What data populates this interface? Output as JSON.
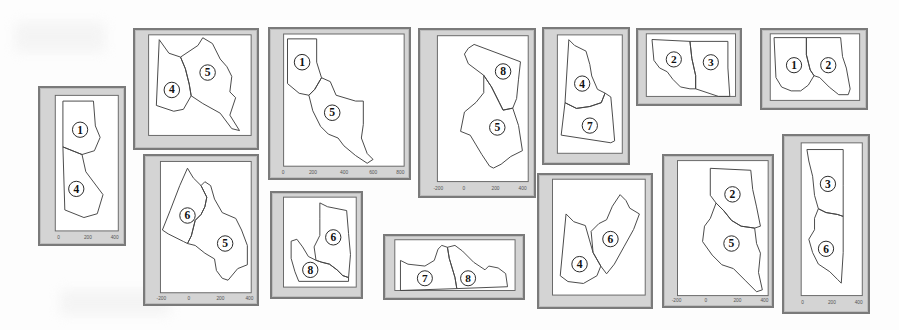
{
  "figure": {
    "panels": [
      {
        "id": "p1",
        "regions": [
          "1",
          "4"
        ],
        "yticks": [
          "0",
          "100",
          "200",
          "300",
          "400",
          "500",
          "600",
          "700",
          "800",
          "900"
        ],
        "xticks": [
          "0",
          "200",
          "400"
        ]
      },
      {
        "id": "p2",
        "regions": [
          "4",
          "5"
        ],
        "yticks": [
          "100",
          "200",
          "300",
          "400",
          "500",
          "600",
          "700"
        ],
        "xticks": [
          "0",
          "100",
          "200",
          "300",
          "400",
          "500",
          "600",
          "700"
        ]
      },
      {
        "id": "p3",
        "regions": [
          "1",
          "5"
        ],
        "yticks": [
          "0",
          "100",
          "200",
          "300",
          "400",
          "500",
          "600",
          "700",
          "800",
          "900"
        ],
        "xticks": [
          "0",
          "200",
          "400",
          "600",
          "800"
        ]
      },
      {
        "id": "p4",
        "regions": [
          "8",
          "5"
        ],
        "yticks": [
          "-200",
          "-100",
          "0",
          "100",
          "200",
          "300",
          "400",
          "500",
          "600",
          "700",
          "800"
        ],
        "xticks": [
          "-200",
          "0",
          "200",
          "400"
        ]
      },
      {
        "id": "p5",
        "regions": [
          "4",
          "7"
        ],
        "yticks": [
          "100",
          "200",
          "300",
          "400",
          "500",
          "600",
          "700",
          "800"
        ],
        "xticks": [
          "0",
          "100",
          "200",
          "300",
          "400"
        ]
      },
      {
        "id": "p6",
        "regions": [
          "2",
          "3"
        ],
        "yticks": [],
        "xticks": []
      },
      {
        "id": "p7",
        "regions": [
          "1",
          "2"
        ],
        "yticks": [],
        "xticks": []
      },
      {
        "id": "p8",
        "regions": [
          "6",
          "5"
        ],
        "yticks": [
          "-100",
          "0",
          "100",
          "200",
          "300",
          "400",
          "500",
          "600",
          "700",
          "800"
        ],
        "xticks": [
          "-200",
          "0",
          "200",
          "400"
        ]
      },
      {
        "id": "p9",
        "regions": [
          "6",
          "8"
        ],
        "yticks": [],
        "xticks": []
      },
      {
        "id": "p10",
        "regions": [
          "7",
          "8"
        ],
        "yticks": [],
        "xticks": []
      },
      {
        "id": "p11",
        "regions": [
          "4",
          "6"
        ],
        "yticks": [
          "-200",
          "-100",
          "0",
          "100",
          "200",
          "300",
          "400",
          "500",
          "600"
        ],
        "xticks": [
          "0",
          "100",
          "200",
          "300",
          "400",
          "500",
          "600"
        ]
      },
      {
        "id": "p12",
        "regions": [
          "2",
          "5"
        ],
        "yticks": [
          "0",
          "100",
          "200",
          "300",
          "400",
          "500",
          "600",
          "700",
          "800",
          "900"
        ],
        "xticks": [
          "-200",
          "0",
          "200",
          "400"
        ]
      },
      {
        "id": "p13",
        "regions": [
          "3",
          "6"
        ],
        "yticks": [
          "0",
          "100",
          "200",
          "300",
          "400",
          "500",
          "600",
          "700",
          "800",
          "900",
          "1000"
        ],
        "xticks": [
          "0",
          "200",
          "400"
        ]
      }
    ]
  },
  "labels": {
    "p1a": "1",
    "p1b": "4",
    "p2a": "4",
    "p2b": "5",
    "p3a": "1",
    "p3b": "5",
    "p4a": "8",
    "p4b": "5",
    "p5a": "4",
    "p5b": "7",
    "p6a": "2",
    "p6b": "3",
    "p7a": "1",
    "p7b": "2",
    "p8a": "6",
    "p8b": "5",
    "p9a": "6",
    "p9b": "8",
    "p10a": "7",
    "p10b": "8",
    "p11a": "4",
    "p11b": "6",
    "p12a": "2",
    "p12b": "5",
    "p13a": "3",
    "p13b": "6"
  },
  "ticks": {
    "p1y": [
      "0",
      "100",
      "200",
      "300",
      "400",
      "500",
      "600",
      "700",
      "800",
      "900"
    ],
    "p1x": [
      "0",
      "200",
      "400"
    ],
    "p3x": [
      "0",
      "200",
      "400",
      "600",
      "800"
    ],
    "p4x": [
      "-200",
      "0",
      "200",
      "400"
    ],
    "p8x": [
      "-200",
      "0",
      "200",
      "400"
    ],
    "p12x": [
      "-200",
      "0",
      "200",
      "400"
    ],
    "p13x": [
      "0",
      "200",
      "400"
    ]
  }
}
